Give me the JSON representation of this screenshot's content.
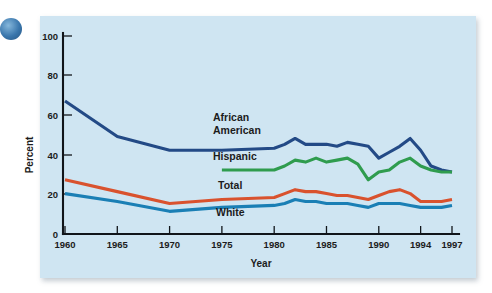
{
  "figure": {
    "background_color": "#cfe5f2",
    "page_color": "#ffffff",
    "corner_bullet_color": "#2f6fa8"
  },
  "chart_data": {
    "type": "line",
    "title": "",
    "subtitle": "",
    "xlabel": "Year",
    "ylabel": "Percent",
    "xlim": [
      1960,
      1997
    ],
    "ylim": [
      0,
      100
    ],
    "grid": false,
    "legend_position": "inline-labels",
    "x_tick_labels": [
      "1960",
      "1965",
      "1970",
      "1975",
      "1980",
      "1985",
      "1990",
      "1994",
      "1997"
    ],
    "x_tick_values": [
      1960,
      1965,
      1970,
      1975,
      1980,
      1985,
      1990,
      1994,
      1997
    ],
    "y_tick_labels": [
      "0",
      "20",
      "40",
      "60",
      "80",
      "100"
    ],
    "y_tick_values": [
      0,
      20,
      40,
      60,
      80,
      100
    ],
    "series": [
      {
        "name": "African American",
        "color": "#234a86",
        "label_lines": [
          "African",
          "American"
        ],
        "x": [
          1960,
          1965,
          1970,
          1975,
          1980,
          1981,
          1982,
          1983,
          1984,
          1985,
          1986,
          1987,
          1988,
          1989,
          1990,
          1991,
          1992,
          1993,
          1994,
          1995,
          1996,
          1997
        ],
        "values": [
          67,
          49,
          42,
          42,
          43,
          45,
          48,
          45,
          45,
          45,
          44,
          46,
          45,
          44,
          38,
          41,
          44,
          48,
          42,
          34,
          32,
          31
        ]
      },
      {
        "name": "Hispanic",
        "color": "#2f9c4e",
        "label_lines": [
          "Hispanic"
        ],
        "x": [
          1975,
          1980,
          1981,
          1982,
          1983,
          1984,
          1985,
          1986,
          1987,
          1988,
          1989,
          1990,
          1991,
          1992,
          1993,
          1994,
          1995,
          1996,
          1997
        ],
        "values": [
          32,
          32,
          34,
          37,
          36,
          38,
          36,
          37,
          38,
          35,
          27,
          31,
          32,
          36,
          38,
          34,
          32,
          31,
          31
        ]
      },
      {
        "name": "Total",
        "color": "#d9522e",
        "label_lines": [
          "Total"
        ],
        "x": [
          1960,
          1965,
          1970,
          1975,
          1980,
          1981,
          1982,
          1983,
          1984,
          1985,
          1986,
          1987,
          1988,
          1989,
          1990,
          1991,
          1992,
          1993,
          1994,
          1995,
          1996,
          1997
        ],
        "values": [
          27,
          21,
          15,
          17,
          18,
          20,
          22,
          21,
          21,
          20,
          19,
          19,
          18,
          17,
          19,
          21,
          22,
          20,
          16,
          16,
          16,
          17
        ]
      },
      {
        "name": "White",
        "color": "#1a7fb5",
        "label_lines": [
          "White"
        ],
        "x": [
          1960,
          1965,
          1970,
          1975,
          1980,
          1981,
          1982,
          1983,
          1984,
          1985,
          1986,
          1987,
          1988,
          1989,
          1990,
          1991,
          1992,
          1993,
          1994,
          1995,
          1996,
          1997
        ],
        "values": [
          20,
          16,
          11,
          13,
          14,
          15,
          17,
          16,
          16,
          15,
          15,
          15,
          14,
          13,
          15,
          15,
          15,
          14,
          13,
          13,
          13,
          14
        ]
      }
    ],
    "annotations": [
      {
        "text": "African",
        "series": "African American"
      },
      {
        "text": "American",
        "series": "African American"
      },
      {
        "text": "Hispanic",
        "series": "Hispanic"
      },
      {
        "text": "Total",
        "series": "Total"
      },
      {
        "text": "White",
        "series": "White"
      }
    ]
  }
}
